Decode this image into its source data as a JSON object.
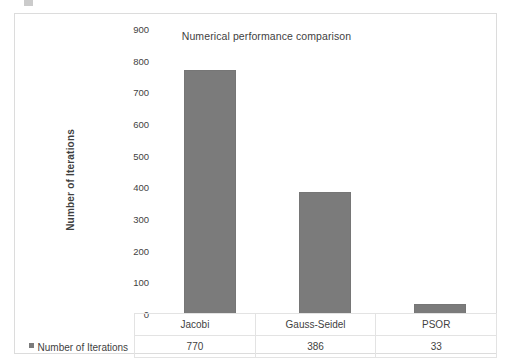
{
  "chart_data": {
    "type": "bar",
    "title": "Numerical performance comparison",
    "xlabel": "",
    "ylabel": "Number of Iterations",
    "categories": [
      "Jacobi",
      "Gauss-Seidel",
      "PSOR"
    ],
    "values": [
      770,
      386,
      33
    ],
    "series": [
      {
        "name": "Number of Iterations",
        "values": [
          770,
          386,
          33
        ]
      }
    ],
    "ylim": [
      0,
      900
    ],
    "yticks": [
      0,
      100,
      200,
      300,
      400,
      500,
      600,
      700,
      800,
      900
    ],
    "ytick_labels": [
      "0",
      "100",
      "200",
      "300",
      "400",
      "500",
      "600",
      "700",
      "800",
      "900"
    ],
    "grid": false,
    "legend_position": "bottom-left-table",
    "bar_color": "#7b7b7b",
    "border_color": "#dcdcdc",
    "text_color": "#3f3f3f"
  },
  "chart": {
    "title": "Numerical performance comparison",
    "y_axis_title": "Number of Iterations"
  },
  "data_table": {
    "legend_label": "Number of Iterations",
    "column_headers": [
      "Jacobi",
      "Gauss-Seidel",
      "PSOR"
    ],
    "row_values": [
      "770",
      "386",
      "33"
    ]
  }
}
